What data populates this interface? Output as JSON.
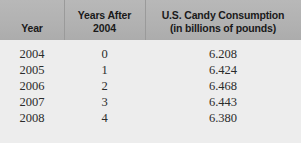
{
  "table": {
    "headers": [
      {
        "id": "year",
        "line1": "Year",
        "line2": ""
      },
      {
        "id": "years-after-2004",
        "line1": "Years After",
        "line2": "2004"
      },
      {
        "id": "us-candy-consumption",
        "line1": "U.S. Candy Consumption",
        "line2": "(in billions of pounds)"
      }
    ],
    "rows": [
      {
        "year": "2004",
        "years_after": "0",
        "consumption": "6.208"
      },
      {
        "year": "2005",
        "years_after": "1",
        "consumption": "6.424"
      },
      {
        "year": "2006",
        "years_after": "2",
        "consumption": "6.468"
      },
      {
        "year": "2007",
        "years_after": "3",
        "consumption": "6.443"
      },
      {
        "year": "2008",
        "years_after": "4",
        "consumption": "6.380"
      }
    ]
  },
  "chart_data": {
    "type": "table",
    "title": "U.S. Candy Consumption",
    "columns": [
      "Year",
      "Years After 2004",
      "U.S. Candy Consumption (in billions of pounds)"
    ],
    "x": [
      0,
      1,
      2,
      3,
      4
    ],
    "xlabel": "Years After 2004",
    "ylabel": "U.S. Candy Consumption (in billions of pounds)",
    "categories": [
      "2004",
      "2005",
      "2006",
      "2007",
      "2008"
    ],
    "values": [
      6.208,
      6.424,
      6.468,
      6.443,
      6.38
    ],
    "ylim": [
      6.0,
      6.6
    ],
    "grid": false
  },
  "colors": {
    "header_background": "#b2b2b2",
    "body_background": "#ededed",
    "divider": "#9a9a9a",
    "header_text": "#1a1a1a",
    "body_text": "#2b2b2b"
  }
}
